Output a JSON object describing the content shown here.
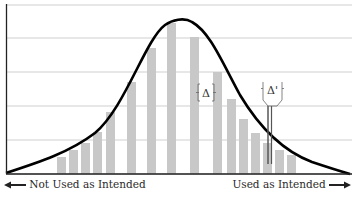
{
  "chart_data": {
    "type": "bar",
    "title": "",
    "xlabel": "",
    "ylabel": "",
    "grid": true,
    "legend": null,
    "categories": [
      "1",
      "2",
      "3",
      "4",
      "5",
      "6",
      "7",
      "8",
      "9",
      "10",
      "11",
      "12",
      "13",
      "14",
      "15",
      "16"
    ],
    "values": [
      17,
      24,
      31,
      42,
      62,
      92,
      126,
      151,
      137,
      102,
      75,
      55,
      41,
      31,
      24,
      19
    ],
    "ylim": [
      0,
      169
    ],
    "gridlines_y": [
      0,
      34,
      68,
      102,
      136,
      169
    ],
    "overlay_curve": {
      "name": "distribution curve",
      "shape": "skewed bell curve",
      "peak_x_px": 178,
      "peak_height": 155
    },
    "annotations": [
      {
        "text": "Δ",
        "type": "bracket",
        "near_bar": 10
      },
      {
        "text": "Δ'",
        "type": "bracket-pointer",
        "near_bar": 15
      }
    ],
    "axis_direction_labels": {
      "left": "Not Used as Intended",
      "right": "Used as Intended"
    }
  },
  "labels": {
    "left": "Not Used as Intended",
    "right": "Used as Intended",
    "delta": "Δ",
    "delta_prime": "Δ'"
  },
  "colors": {
    "bar": "#c8c8c8",
    "curve": "#000000",
    "grid": "#cfcfcf",
    "axis": "#222222"
  }
}
